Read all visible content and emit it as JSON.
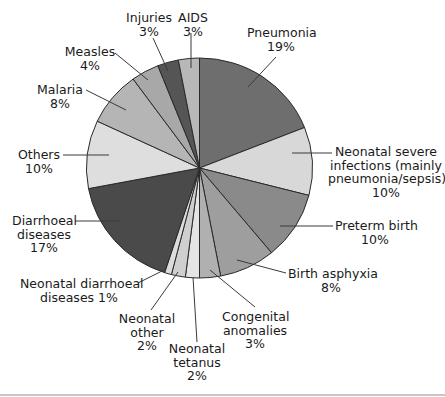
{
  "chart_data": {
    "type": "pie",
    "title": "",
    "start_angle_deg": 0,
    "direction": "clockwise",
    "slices": [
      {
        "label": "Pneumonia",
        "value": 19,
        "color": "#6e6e6e"
      },
      {
        "label": "Neonatal severe infections (mainly pneumonia/sepsis)",
        "value": 10,
        "color": "#d8d8d8"
      },
      {
        "label": "Preterm birth",
        "value": 10,
        "color": "#8a8a8a"
      },
      {
        "label": "Birth asphyxia",
        "value": 8,
        "color": "#9e9e9e"
      },
      {
        "label": "Congenital anomalies",
        "value": 3,
        "color": "#b0b0b0"
      },
      {
        "label": "Neonatal tetanus",
        "value": 2,
        "color": "#e4e4e4"
      },
      {
        "label": "Neonatal other",
        "value": 2,
        "color": "#cfcfcf"
      },
      {
        "label": "Neonatal diarrhoeal diseases",
        "value": 1,
        "color": "#dcdcdc"
      },
      {
        "label": "Diarrhoeal diseases",
        "value": 17,
        "color": "#4a4a4a"
      },
      {
        "label": "Others",
        "value": 10,
        "color": "#dedede"
      },
      {
        "label": "Malaria",
        "value": 8,
        "color": "#b5b5b5"
      },
      {
        "label": "Measles",
        "value": 4,
        "color": "#a8a8a8"
      },
      {
        "label": "Injuries",
        "value": 3,
        "color": "#555555"
      },
      {
        "label": "AIDS",
        "value": 3,
        "color": "#b8b8b8"
      }
    ],
    "unit": "%",
    "legend": "none (direct labels with leader lines)"
  },
  "labels": {
    "pneumonia": "Pneumonia\n19%",
    "neonatal_severe": "Neonatal severe\ninfections (mainly\npneumonia/sepsis)\n10%",
    "preterm": "Preterm birth\n10%",
    "birth_asphyxia": "Birth asphyxia\n8%",
    "congenital": "Congenital\nanomalies\n3%",
    "neonatal_tetanus": "Neonatal\ntetanus\n2%",
    "neonatal_other": "Neonatal\nother\n2%",
    "neonatal_diarrhoeal": "Neonatal diarrhoeal\ndiseases 1%",
    "diarrhoeal": "Diarrhoeal\ndiseases\n17%",
    "others": "Others\n10%",
    "malaria": "Malaria\n8%",
    "measles": "Measles\n4%",
    "injuries": "Injuries\n3%",
    "aids": "AIDS\n3%"
  }
}
